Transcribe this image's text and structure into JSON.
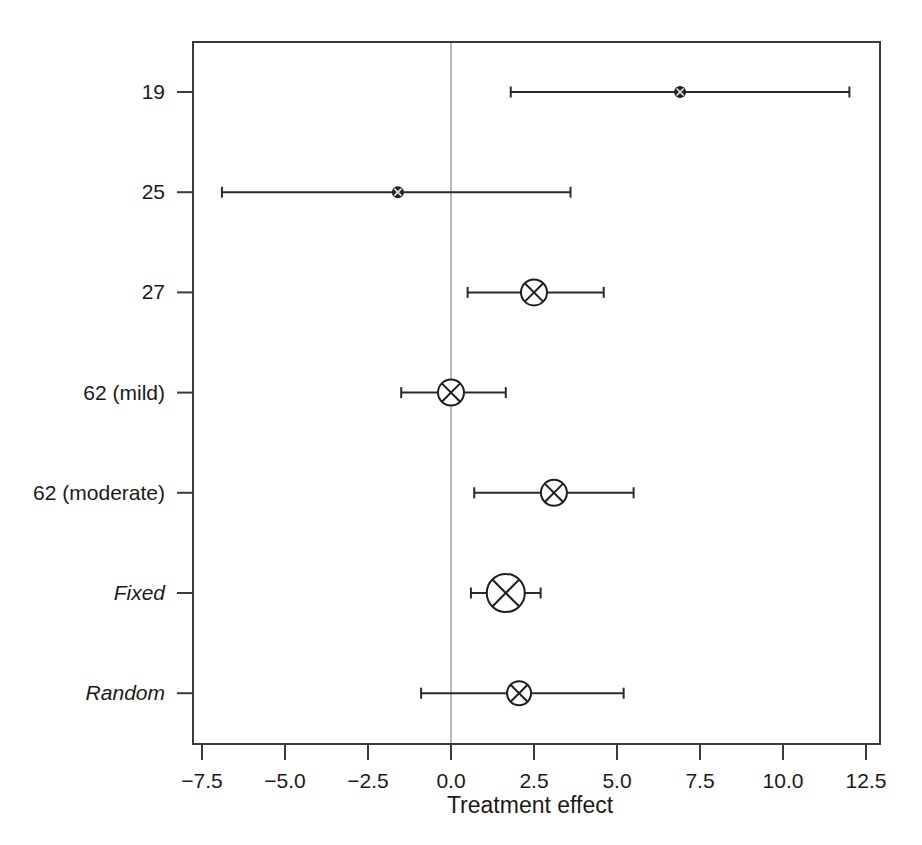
{
  "chart_data": {
    "type": "forest",
    "title": "",
    "xlabel": "Treatment effect",
    "ylabel": "",
    "xlim": [
      -8.6,
      13.3
    ],
    "xticks": [
      -7.5,
      -5.0,
      -2.5,
      0.0,
      2.5,
      5.0,
      7.5,
      10.0,
      12.5
    ],
    "xticklabels": [
      "−7.5",
      "−5.0",
      "−2.5",
      "0.0",
      "2.5",
      "5.0",
      "7.5",
      "10.0",
      "12.5"
    ],
    "reference_line": 0.0,
    "grid": false,
    "legend": "none",
    "categories": [
      "19",
      "25",
      "27",
      "62 (mild)",
      "62 (moderate)",
      "Fixed",
      "Random"
    ],
    "rows": [
      {
        "label": "19",
        "italic": false,
        "estimate": 6.9,
        "ci_low": 1.8,
        "ci_high": 12.0,
        "marker": "small-circle-cross",
        "marker_radius": 5,
        "filled": true
      },
      {
        "label": "25",
        "italic": false,
        "estimate": -1.6,
        "ci_low": -6.9,
        "ci_high": 3.6,
        "marker": "small-circle-cross",
        "marker_radius": 5,
        "filled": true
      },
      {
        "label": "27",
        "italic": false,
        "estimate": 2.5,
        "ci_low": 0.5,
        "ci_high": 4.6,
        "marker": "circle-cross",
        "marker_radius": 13,
        "filled": false
      },
      {
        "label": "62 (mild)",
        "italic": false,
        "estimate": 0.0,
        "ci_low": -1.5,
        "ci_high": 1.65,
        "marker": "circle-cross",
        "marker_radius": 13,
        "filled": false
      },
      {
        "label": "62 (moderate)",
        "italic": false,
        "estimate": 3.1,
        "ci_low": 0.7,
        "ci_high": 5.5,
        "marker": "circle-cross",
        "marker_radius": 13,
        "filled": false
      },
      {
        "label": "Fixed",
        "italic": true,
        "estimate": 1.65,
        "ci_low": 0.6,
        "ci_high": 2.7,
        "marker": "circle-cross",
        "marker_radius": 19,
        "filled": false
      },
      {
        "label": "Random",
        "italic": true,
        "estimate": 2.05,
        "ci_low": -0.9,
        "ci_high": 5.2,
        "marker": "circle-cross",
        "marker_radius": 12,
        "filled": false
      }
    ]
  },
  "colors": {
    "frame": "#3a3a3a",
    "reference": "#a8a8a8",
    "interval": "#2b2b2b",
    "marker": "#1f1f1f",
    "background": "#ffffff"
  }
}
